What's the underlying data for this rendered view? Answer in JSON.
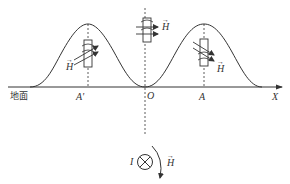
{
  "diagram": {
    "ground_label": "地面",
    "axis_label": "X",
    "points": {
      "left": "A'",
      "origin": "O",
      "right": "A"
    },
    "field_label": "H",
    "current_label": "I",
    "vector_arrow": "→",
    "colors": {
      "line": "#333333",
      "background": "#ffffff"
    }
  }
}
